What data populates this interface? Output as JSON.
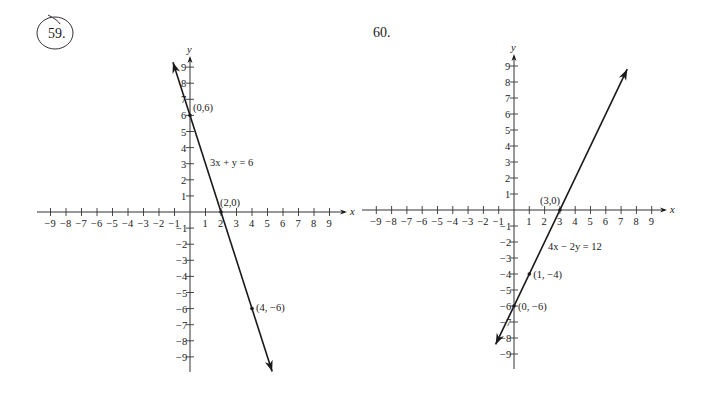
{
  "problems": [
    {
      "number": "59.",
      "circled": true,
      "equation": "3x + y = 6",
      "axis_labels": {
        "x": "x",
        "y": "y"
      },
      "points": [
        {
          "label": "(0,6)",
          "x": 0,
          "y": 6
        },
        {
          "label": "(2,0)",
          "x": 2,
          "y": 0
        },
        {
          "label": "(4, −6)",
          "x": 4,
          "y": -6
        }
      ]
    },
    {
      "number": "60.",
      "circled": false,
      "equation": "4x − 2y = 12",
      "axis_labels": {
        "x": "x",
        "y": "y"
      },
      "points": [
        {
          "label": "(3,0)",
          "x": 3,
          "y": 0
        },
        {
          "label": "(1, −4)",
          "x": 1,
          "y": -4
        },
        {
          "label": "(0, −6)",
          "x": 0,
          "y": -6
        }
      ]
    }
  ],
  "x_tick_labels": [
    "−9",
    "−8",
    "−7",
    "−6",
    "−5",
    "−4",
    "−3",
    "−2",
    "−1",
    "1",
    "2",
    "3",
    "4",
    "5",
    "6",
    "7",
    "8",
    "9"
  ],
  "y_tick_labels": [
    "9",
    "8",
    "7",
    "6",
    "5",
    "4",
    "3",
    "2",
    "1",
    "−1",
    "−2",
    "−3",
    "−4",
    "−5",
    "−6",
    "−7",
    "−8",
    "−9"
  ],
  "chart_data": [
    {
      "type": "line",
      "title": "59. 3x + y = 6",
      "xlabel": "x",
      "ylabel": "y",
      "xlim": [
        -9,
        9
      ],
      "ylim": [
        -9,
        9
      ],
      "grid": false,
      "series": [
        {
          "name": "3x + y = 6",
          "x": [
            -1.1,
            0,
            2,
            4,
            5.3
          ],
          "y": [
            9.3,
            6,
            0,
            -6,
            -9.9
          ]
        }
      ],
      "annotations": [
        "(0,6)",
        "(2,0)",
        "(4, −6)",
        "3x + y = 6"
      ]
    },
    {
      "type": "line",
      "title": "60. 4x − 2y = 12",
      "xlabel": "x",
      "ylabel": "y",
      "xlim": [
        -9,
        9
      ],
      "ylim": [
        -9,
        9
      ],
      "grid": false,
      "series": [
        {
          "name": "4x − 2y = 12",
          "x": [
            -1.2,
            0,
            1,
            3,
            7.4
          ],
          "y": [
            -8.4,
            -6,
            -4,
            0,
            8.8
          ]
        }
      ],
      "annotations": [
        "(3,0)",
        "(1, −4)",
        "(0, −6)",
        "4x − 2y = 12"
      ]
    }
  ]
}
